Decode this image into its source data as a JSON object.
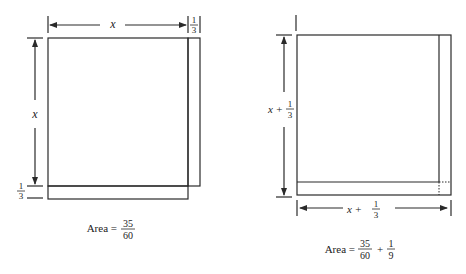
{
  "left_figure": {
    "top_label": "x",
    "top_strip_num": "1",
    "top_strip_den": "3",
    "side_label": "x",
    "bottom_strip_num": "1",
    "bottom_strip_den": "3",
    "area_prefix": "Area =",
    "area_num": "35",
    "area_den": "60"
  },
  "right_figure": {
    "side_label_var": "x +",
    "side_num": "1",
    "side_den": "3",
    "bottom_label_var": "x +",
    "bottom_num": "1",
    "bottom_den": "3",
    "area_prefix": "Area =",
    "area_num": "35",
    "area_den": "60",
    "area_plus": "+",
    "area_num2": "1",
    "area_den2": "9"
  }
}
